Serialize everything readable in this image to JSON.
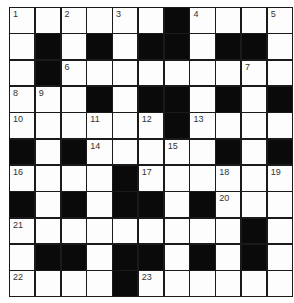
{
  "puzzle": {
    "type": "crossword",
    "rows": 11,
    "cols": 11,
    "grid": [
      "WWWWWWBWWWW",
      "WBWBWBBWBBW",
      "WBWWWWWWWWW",
      "WWWBWBBWBWB",
      "WWWWWWBWWWW",
      "BWBWWWWWBWB",
      "WWWWBWWWWWW",
      "BWBWBBWBWWW",
      "WWWWWWWWWBW",
      "WBBWBBWBWBW",
      "WWWWBWWWWWW"
    ],
    "numbers": [
      {
        "r": 0,
        "c": 0,
        "n": "1"
      },
      {
        "r": 0,
        "c": 2,
        "n": "2"
      },
      {
        "r": 0,
        "c": 4,
        "n": "3"
      },
      {
        "r": 0,
        "c": 7,
        "n": "4"
      },
      {
        "r": 0,
        "c": 10,
        "n": "5"
      },
      {
        "r": 2,
        "c": 2,
        "n": "6"
      },
      {
        "r": 2,
        "c": 9,
        "n": "7"
      },
      {
        "r": 3,
        "c": 0,
        "n": "8"
      },
      {
        "r": 3,
        "c": 1,
        "n": "9"
      },
      {
        "r": 4,
        "c": 0,
        "n": "10"
      },
      {
        "r": 4,
        "c": 3,
        "n": "11"
      },
      {
        "r": 4,
        "c": 5,
        "n": "12"
      },
      {
        "r": 4,
        "c": 7,
        "n": "13"
      },
      {
        "r": 5,
        "c": 3,
        "n": "14"
      },
      {
        "r": 5,
        "c": 6,
        "n": "15"
      },
      {
        "r": 6,
        "c": 0,
        "n": "16"
      },
      {
        "r": 6,
        "c": 5,
        "n": "17"
      },
      {
        "r": 6,
        "c": 8,
        "n": "18"
      },
      {
        "r": 6,
        "c": 10,
        "n": "19"
      },
      {
        "r": 7,
        "c": 8,
        "n": "20"
      },
      {
        "r": 8,
        "c": 0,
        "n": "21"
      },
      {
        "r": 10,
        "c": 0,
        "n": "22"
      },
      {
        "r": 10,
        "c": 5,
        "n": "23"
      }
    ],
    "colors": {
      "black_cell": "#0a0a0a",
      "white_cell": "#fdfdfd",
      "border": "#1a1a1a",
      "number": "#333333"
    }
  }
}
